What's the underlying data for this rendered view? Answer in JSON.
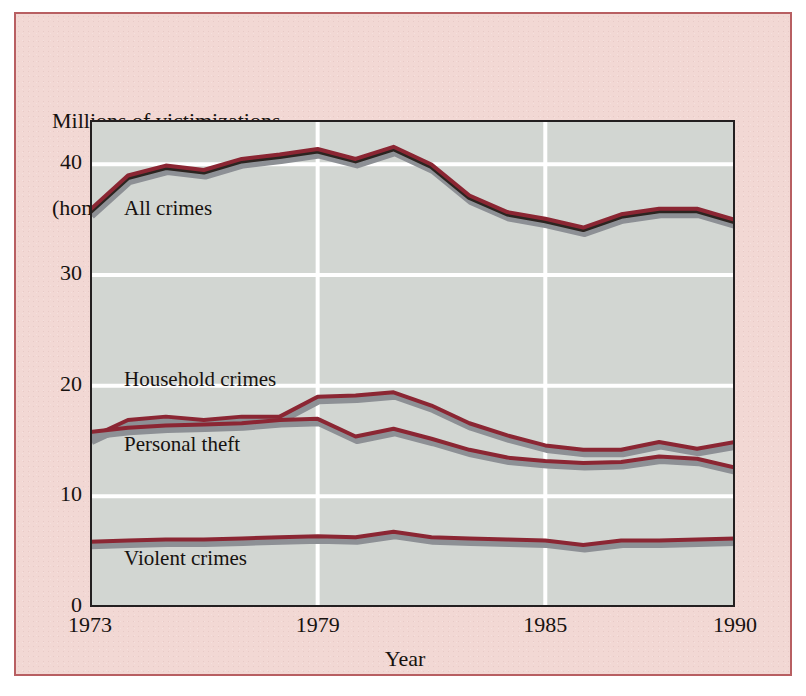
{
  "chart_data": {
    "type": "line",
    "title": "Millions of victimizations (homicides excluded)",
    "title_line1": "Millions of victimizations",
    "title_line2": "(homicides excluded)",
    "xlabel": "Year",
    "ylabel": "",
    "xlim": [
      1973,
      1990
    ],
    "ylim": [
      0,
      44
    ],
    "grid": true,
    "grid_color": "#ffffff",
    "plot_background": "#d2d6d2",
    "line_color": "#8b2633",
    "shadow_color": "#8d9095",
    "legend": "inline-labels",
    "x": [
      1973,
      1974,
      1975,
      1976,
      1977,
      1978,
      1979,
      1980,
      1981,
      1982,
      1983,
      1984,
      1985,
      1986,
      1987,
      1988,
      1989,
      1990
    ],
    "xticks": [
      1973,
      1979,
      1985,
      1990
    ],
    "xticklabels": [
      "1973",
      "1979",
      "1985",
      "1990"
    ],
    "yticks": [
      0,
      10,
      20,
      30,
      40
    ],
    "yticklabels": [
      "0",
      "10",
      "20",
      "30",
      "40"
    ],
    "series": [
      {
        "name": "All crimes",
        "label": "All crimes",
        "values": [
          35.7,
          38.8,
          39.7,
          39.3,
          40.3,
          40.7,
          41.2,
          40.3,
          41.4,
          39.8,
          37.0,
          35.5,
          34.9,
          34.1,
          35.3,
          35.8,
          35.8,
          34.8
        ]
      },
      {
        "name": "Household crimes",
        "label": "Household crimes",
        "values": [
          15.3,
          16.9,
          17.2,
          16.9,
          17.2,
          17.2,
          19.0,
          19.1,
          19.4,
          18.2,
          16.6,
          15.5,
          14.6,
          14.2,
          14.2,
          14.9,
          14.3,
          14.9
        ]
      },
      {
        "name": "Personal theft",
        "label": "Personal theft",
        "values": [
          15.8,
          16.2,
          16.4,
          16.5,
          16.6,
          16.9,
          17.0,
          15.4,
          16.1,
          15.2,
          14.2,
          13.5,
          13.2,
          13.0,
          13.1,
          13.6,
          13.4,
          12.6
        ]
      },
      {
        "name": "Violent crimes",
        "label": "Violent crimes",
        "values": [
          5.9,
          6.0,
          6.1,
          6.1,
          6.2,
          6.3,
          6.4,
          6.3,
          6.8,
          6.3,
          6.2,
          6.1,
          6.0,
          5.6,
          6.0,
          6.0,
          6.1,
          6.2
        ]
      }
    ],
    "series_label_positions": [
      {
        "name": "All crimes",
        "left": 34,
        "top": 76
      },
      {
        "name": "Household crimes",
        "left": 34,
        "top": 247
      },
      {
        "name": "Personal theft",
        "left": 34,
        "top": 312
      },
      {
        "name": "Violent crimes",
        "left": 34,
        "top": 426
      }
    ]
  }
}
